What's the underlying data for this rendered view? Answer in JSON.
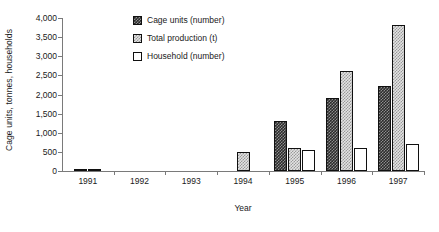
{
  "chart_data": {
    "type": "bar",
    "title": "",
    "xlabel": "Year",
    "ylabel": "Cage units, tonnes, households",
    "categories": [
      "1991",
      "1992",
      "1993",
      "1994",
      "1995",
      "1996",
      "1997"
    ],
    "series": [
      {
        "name": "Cage units (number)",
        "swatch": "dark-checker",
        "values": [
          40,
          0,
          0,
          0,
          1300,
          1900,
          2210
        ]
      },
      {
        "name": "Total production (t)",
        "swatch": "light-checker",
        "values": [
          40,
          0,
          0,
          500,
          590,
          2610,
          3810
        ]
      },
      {
        "name": "Household (number)",
        "swatch": "white",
        "values": [
          0,
          0,
          0,
          0,
          550,
          600,
          700
        ]
      }
    ],
    "ylim": [
      0,
      4000
    ],
    "ytick_values": [
      0,
      500,
      1000,
      1500,
      2000,
      2500,
      3000,
      3500,
      4000
    ],
    "ytick_labels": [
      "0",
      "500",
      "1,000",
      "1,500",
      "2,000",
      "2,500",
      "3,000",
      "3,500",
      "4,000"
    ],
    "grid": false,
    "legend_position": "top-center"
  }
}
